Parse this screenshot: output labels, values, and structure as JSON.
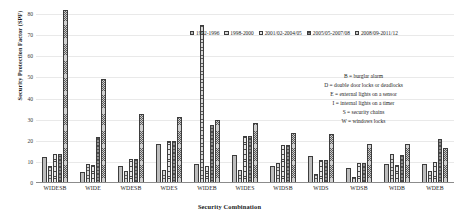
{
  "chart_data": {
    "type": "bar",
    "title": "",
    "xlabel": "Security Combination",
    "ylabel": "Security Protection Factor (SPF)",
    "ylim": [
      0,
      80
    ],
    "yticks": [
      0,
      10,
      20,
      30,
      40,
      50,
      60,
      70,
      80
    ],
    "grid": true,
    "legend_position": "top-right",
    "categories": [
      "WIDESB",
      "WIDE",
      "WDESB",
      "WDES",
      "WIDEB",
      "WIDES",
      "WIDSB",
      "WIDS",
      "WDSB",
      "WIDB",
      "WDEB"
    ],
    "series": [
      {
        "name": "1992-1996",
        "values": [
          12.5,
          5.0,
          8.0,
          18.3,
          9.2,
          13.2,
          8.0,
          12.6,
          7.1,
          9.1,
          9.2
        ]
      },
      {
        "name": "1998-2000",
        "values": [
          8.1,
          9.0,
          5.6,
          6.0,
          75.0,
          6.1,
          9.4,
          4.3,
          3.0,
          13.8,
          5.5
        ]
      },
      {
        "name": "2001/02-2004/05",
        "values": [
          13.9,
          8.5,
          11.2,
          20.1,
          8.0,
          22.2,
          17.8,
          10.7,
          9.6,
          8.4,
          10.1
        ]
      },
      {
        "name": "2005/05-2007/08",
        "values": [
          13.9,
          22.0,
          11.2,
          20.1,
          27.6,
          22.2,
          17.8,
          10.7,
          9.6,
          13.3,
          20.8
        ]
      },
      {
        "name": "2008/09-2011/12",
        "values": [
          82.0,
          49.2,
          32.5,
          31.4,
          29.9,
          28.6,
          23.6,
          23.0,
          18.7,
          18.3,
          16.4
        ]
      }
    ]
  },
  "legend": {
    "items": [
      {
        "label": "1992-1996"
      },
      {
        "label": "1998-2000"
      },
      {
        "label": "2001/02-2004/05"
      },
      {
        "label": "2005/05-2007/08"
      },
      {
        "label": "2008/09-2011/12"
      }
    ]
  },
  "key_block": {
    "lines": [
      "B = burglar alarm",
      "D = double door locks or deadlocks",
      "E = external lights on a sensor",
      "I = internal lights on a timer",
      "S = security chains",
      "W = windows locks"
    ]
  },
  "axes": {
    "y_title": "Security Protection Factor (SPF)",
    "x_title": "Security Combination"
  },
  "colors": {
    "axis": "#8c8c8c",
    "grid": "#e9e9e9",
    "bar_outline": "#3d3d3d",
    "text": "#1a1a1a"
  }
}
